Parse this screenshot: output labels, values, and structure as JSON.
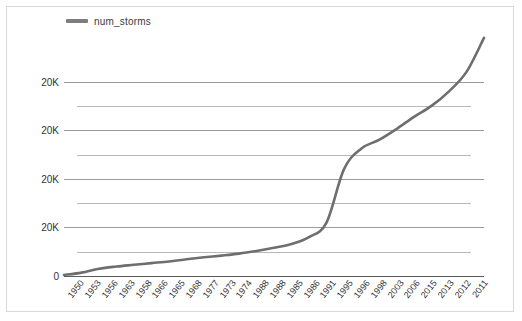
{
  "chart_data": {
    "type": "line",
    "title": "",
    "xlabel": "",
    "ylabel": "",
    "legend": [
      {
        "name": "num_storms",
        "color": "#7d7d7d"
      }
    ],
    "legend_position": "top-left",
    "grid": true,
    "ylim": [
      0,
      100000
    ],
    "y_tick_labels": [
      "20K",
      "20K",
      "20K",
      "20K",
      "0"
    ],
    "y_tick_values": [
      80000,
      60000,
      40000,
      20000,
      0
    ],
    "minor_gridlines": 4,
    "categories": [
      "1950",
      "1953",
      "1956",
      "1963",
      "1958",
      "1966",
      "1965",
      "1968",
      "1977",
      "1973",
      "1974",
      "1988",
      "1988",
      "1985",
      "1986",
      "1991",
      "1995",
      "1996",
      "1998",
      "2003",
      "2006",
      "2015",
      "2013",
      "2012",
      "2011"
    ],
    "series": [
      {
        "name": "num_storms",
        "color": "#6e6e6e",
        "values": [
          400,
          1400,
          3000,
          3900,
          4600,
          5300,
          6000,
          6900,
          7700,
          8400,
          9200,
          10300,
          11600,
          13200,
          16000,
          22000,
          44000,
          52500,
          56000,
          60500,
          65500,
          70000,
          76000,
          84000,
          98000
        ]
      }
    ]
  },
  "legend_entry": {
    "label": "num_storms"
  }
}
